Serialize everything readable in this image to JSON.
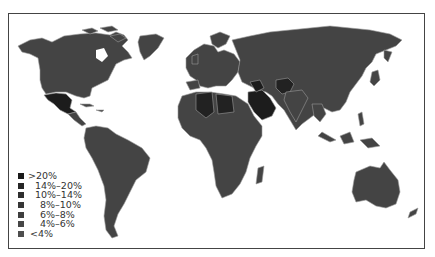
{
  "map": {
    "title": "",
    "type": "choropleth world map",
    "legend": {
      "items": [
        {
          "label": ">20%",
          "color": "#1a1a1a"
        },
        {
          "label": "14%–20%",
          "color": "#262626"
        },
        {
          "label": "10%–14%",
          "color": "#2e2e2e"
        },
        {
          "label": "8%–10%",
          "color": "#363636"
        },
        {
          "label": "6%–8%",
          "color": "#3e3e3e"
        },
        {
          "label": "4%–6%",
          "color": "#464646"
        },
        {
          "label": "<4%",
          "color": "#4e4e4e"
        }
      ]
    },
    "colors": {
      "land_default": "#444444",
      "border": "#9a9a9a",
      "frame": "#444444",
      "background": "#ffffff",
      "highlight_dark": "#1c1c1c"
    },
    "highlighted_regions": [
      {
        "name": "Mexico",
        "class": ">20%"
      },
      {
        "name": "Algeria",
        "class": "14%–20%"
      },
      {
        "name": "Libya",
        "class": "14%–20%"
      },
      {
        "name": "Saudi Arabia",
        "class": ">20%"
      },
      {
        "name": "Iraq",
        "class": ">20%"
      },
      {
        "name": "Pakistan",
        "class": "14%–20%"
      },
      {
        "name": "Afghanistan",
        "class": "14%–20%"
      }
    ]
  }
}
